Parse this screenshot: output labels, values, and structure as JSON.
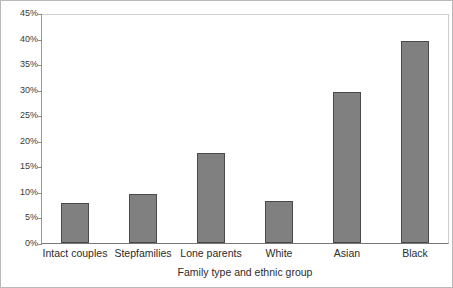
{
  "chart_data": {
    "type": "bar",
    "title": "",
    "subtitle": "",
    "xlabel": "Family type and ethnic group",
    "ylabel": "",
    "categories": [
      "Intact couples",
      "Stepfamilies",
      "Lone parents",
      "White",
      "Asian",
      "Black"
    ],
    "values": [
      7.8,
      9.6,
      17.6,
      8.2,
      29.5,
      39.5
    ],
    "ylim": [
      0,
      45
    ],
    "ytick_step": 5,
    "ytick_labels": [
      "0%",
      "5%",
      "10%",
      "15%",
      "20%",
      "25%",
      "30%",
      "35%",
      "40%",
      "45%"
    ],
    "ytick_values": [
      0,
      5,
      10,
      15,
      20,
      25,
      30,
      35,
      40,
      45
    ],
    "grid": false,
    "legend": false,
    "legend_position": "none",
    "annotations": [],
    "colors": {
      "bar_fill": "#808080",
      "bar_border": "#4a4a4a",
      "axis": "#777777",
      "plot_border": "#cfcfcf",
      "frame_border": "#b9b9b9",
      "text": "#2b2b2b",
      "background": "#ffffff"
    }
  }
}
